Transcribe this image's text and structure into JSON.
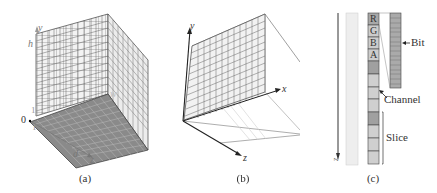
{
  "panels": [
    {
      "id": "a",
      "caption": "(a)",
      "axes": {
        "y": "y",
        "z": "z",
        "h": "h",
        "w": "w",
        "d": "d",
        "origin": "0",
        "one_y": "1",
        "one_z": "1"
      }
    },
    {
      "id": "b",
      "caption": "(b)",
      "axes": {
        "y": "y",
        "x": "x",
        "z": "z"
      }
    },
    {
      "id": "c",
      "caption": "(c)",
      "axis": "z",
      "channel_cells": [
        "R",
        "G",
        "B",
        "A"
      ],
      "labels": {
        "bit": "Bit",
        "channel": "Channel",
        "slice": "Slice"
      }
    }
  ],
  "colors": {
    "grid_face": "#f2f2f2",
    "grid_line": "#555555",
    "bottom_face": "#888888",
    "cell_dark": "#9a9a9a",
    "cell_light": "#cfcfcf",
    "strip": "#e6e6e6"
  }
}
